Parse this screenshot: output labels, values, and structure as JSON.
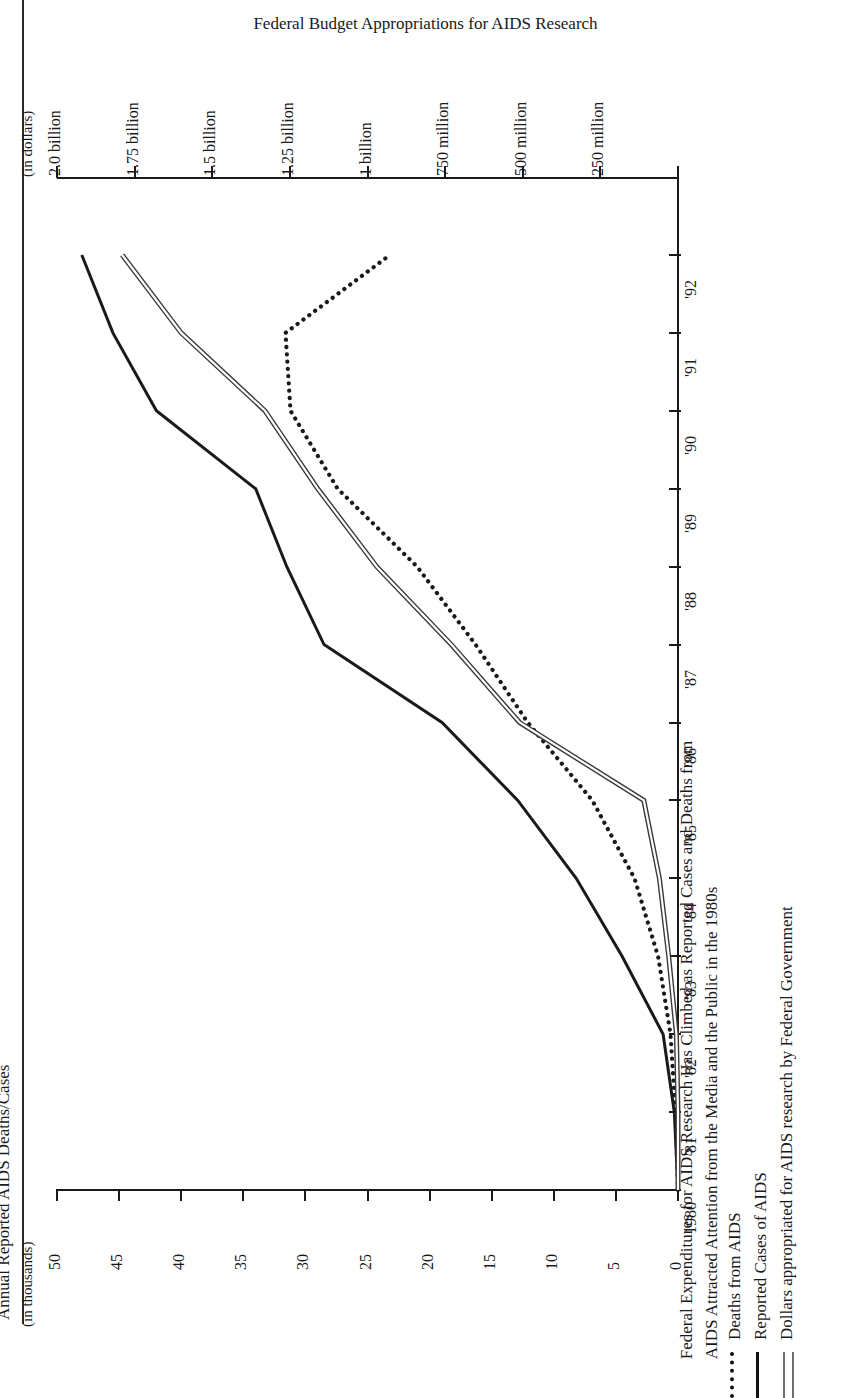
{
  "page": {
    "running_head": "AND DEATHS FROM AIDS"
  },
  "figure": {
    "title": "Federal Budget Appropriations for AIDS Research",
    "caption_line1": "Federal Expenditures for AIDS Research Has Climbed as Reported Cases and Deaths from",
    "caption_line2": "AIDS Attracted Attention from the Media and the Public in the 1980s",
    "left_axis_title": "Annual Reported AIDS Deaths/Cases",
    "left_axis_unit": "(in thousands)",
    "right_axis_unit": "(in dollars)"
  },
  "legend": {
    "items": [
      {
        "key": "dotted",
        "label": "Deaths from AIDS"
      },
      {
        "key": "solid",
        "label": "Reported Cases of AIDS"
      },
      {
        "key": "double",
        "label": "Dollars appropriated for AIDS research by Federal Government"
      }
    ]
  },
  "chart_data": {
    "type": "line",
    "title": "Federal Budget Appropriations for AIDS Research",
    "subtitle": "Federal Expenditures for AIDS Research Has Climbed as Reported Cases and Deaths from AIDS Attracted Attention from the Media and the Public in the 1980s",
    "orientation": "rotated-90",
    "xlabel": "",
    "x_tick_labels": [
      "1980",
      "'81",
      "'82",
      "'83",
      "'84",
      "'85",
      "'86",
      "'87",
      "'88",
      "'89",
      "'90",
      "'91",
      "'92"
    ],
    "x": [
      1980,
      1981,
      1982,
      1983,
      1984,
      1985,
      1986,
      1987,
      1988,
      1989,
      1990,
      1991,
      1992
    ],
    "grid": false,
    "legend_position": "below-caption",
    "axes": [
      {
        "id": "cases-axis",
        "name": "Annual Reported AIDS Deaths/Cases",
        "unit": "(in thousands)",
        "side": "left",
        "range": [
          0,
          50
        ],
        "tick_values": [
          0,
          5,
          10,
          15,
          20,
          25,
          30,
          35,
          40,
          45,
          50
        ],
        "tick_labels": [
          "0",
          "5",
          "10",
          "15",
          "20",
          "25",
          "30",
          "35",
          "40",
          "45",
          "50"
        ]
      },
      {
        "id": "dollars-axis",
        "name": "Federal Budget Appropriations for AIDS Research",
        "unit": "(in dollars)",
        "side": "right",
        "range": [
          0,
          2000000000
        ],
        "tick_values": [
          0,
          250000000,
          500000000,
          750000000,
          1000000000,
          1250000000,
          1500000000,
          1750000000,
          2000000000
        ],
        "tick_labels": [
          "",
          "250 million",
          "500 million",
          "750 million",
          "1 billion",
          "1.25 billion",
          "1.5 billion",
          "1.75 billion",
          "2.0 billion"
        ]
      }
    ],
    "series": [
      {
        "name": "Deaths from AIDS",
        "style": "dotted",
        "axis": "cases-axis",
        "unit": "thousands",
        "values": [
          0,
          0.2,
          0.6,
          1.6,
          3.5,
          6.9,
          12.1,
          16.3,
          21.0,
          27.4,
          31.2,
          31.6,
          23.2
        ]
      },
      {
        "name": "Reported Cases of AIDS",
        "style": "solid",
        "axis": "cases-axis",
        "unit": "thousands",
        "values": [
          0,
          0.3,
          1.2,
          4.5,
          8.2,
          12.9,
          19.0,
          28.5,
          31.5,
          34.0,
          42.0,
          45.5,
          48.0
        ]
      },
      {
        "name": "Dollars appropriated for AIDS research by Federal Government",
        "style": "double",
        "axis": "dollars-axis",
        "unit": "dollars",
        "values": [
          0,
          0,
          5000000,
          30000000,
          60000000,
          110000000,
          510000000,
          730000000,
          970000000,
          1160000000,
          1330000000,
          1600000000,
          1790000000
        ]
      }
    ]
  },
  "colors": {
    "ink": "#1a1a1a",
    "double_line": "#6f6f6f",
    "background": "#ffffff"
  }
}
